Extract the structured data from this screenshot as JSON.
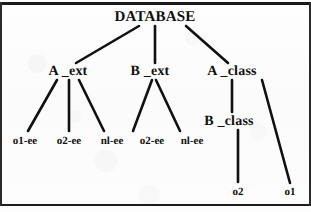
{
  "figure": {
    "ink_color": "#101010",
    "paper_color": "#fdfdfd",
    "rule_color": "#1c1c1c"
  },
  "nodes": {
    "root": {
      "label": "DATABASE",
      "x": 155,
      "y": 17
    },
    "a_ext": {
      "label": "A _ext",
      "x": 68,
      "y": 72
    },
    "b_ext": {
      "label": "B _ext",
      "x": 150,
      "y": 72
    },
    "a_class": {
      "label": "A _class",
      "x": 232,
      "y": 72
    },
    "b_class": {
      "label": "B _class",
      "x": 229,
      "y": 122
    },
    "leaf_o1_ee": {
      "label": "o1-ee",
      "x": 25,
      "y": 141
    },
    "leaf_o2_ee_a": {
      "label": "o2-ee",
      "x": 69,
      "y": 141
    },
    "leaf_nl_ee_a": {
      "label": "nl-ee",
      "x": 112,
      "y": 141
    },
    "leaf_o2_ee_b": {
      "label": "o2-ee",
      "x": 152,
      "y": 141
    },
    "leaf_nl_ee_b": {
      "label": "nl-ee",
      "x": 192,
      "y": 141
    },
    "leaf_o2": {
      "label": "o2",
      "x": 238,
      "y": 192
    },
    "leaf_o1": {
      "label": "o1",
      "x": 290,
      "y": 192
    }
  },
  "edges": [
    {
      "name": "database-to-a-ext",
      "from": "DATABASE",
      "to": "A _ext",
      "x1": 139,
      "y1": 26,
      "x2": 76,
      "y2": 63
    },
    {
      "name": "database-to-b-ext",
      "from": "DATABASE",
      "to": "B _ext",
      "x1": 155,
      "y1": 26,
      "x2": 155,
      "y2": 63
    },
    {
      "name": "database-to-a-class",
      "from": "DATABASE",
      "to": "A _class",
      "x1": 186,
      "y1": 26,
      "x2": 228,
      "y2": 63
    },
    {
      "name": "a-ext-to-o1-ee",
      "from": "A _ext",
      "to": "o1-ee",
      "x1": 57,
      "y1": 80,
      "x2": 28,
      "y2": 131
    },
    {
      "name": "a-ext-to-o2-ee",
      "from": "A _ext",
      "to": "o2-ee",
      "x1": 69,
      "y1": 80,
      "x2": 69,
      "y2": 131
    },
    {
      "name": "a-ext-to-nl-ee",
      "from": "A _ext",
      "to": "nl-ee",
      "x1": 79,
      "y1": 80,
      "x2": 104,
      "y2": 131
    },
    {
      "name": "b-ext-to-o2-ee",
      "from": "B _ext",
      "to": "o2-ee",
      "x1": 152,
      "y1": 80,
      "x2": 133,
      "y2": 131
    },
    {
      "name": "b-ext-to-nl-ee",
      "from": "B _ext",
      "to": "nl-ee",
      "x1": 156,
      "y1": 80,
      "x2": 180,
      "y2": 131
    },
    {
      "name": "a-class-to-b-class",
      "from": "A _class",
      "to": "B _class",
      "x1": 232,
      "y1": 80,
      "x2": 232,
      "y2": 112
    },
    {
      "name": "a-class-to-o1",
      "from": "A _class",
      "to": "o1",
      "x1": 262,
      "y1": 80,
      "x2": 290,
      "y2": 183
    },
    {
      "name": "b-class-to-o2",
      "from": "B _class",
      "to": "o2",
      "x1": 238,
      "y1": 130,
      "x2": 238,
      "y2": 182
    }
  ]
}
